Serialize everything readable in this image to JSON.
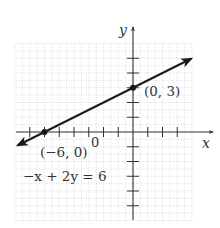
{
  "chart_data": {
    "type": "line",
    "title": "",
    "equation": "−x + 2y = 6",
    "xlabel": "x",
    "ylabel": "y",
    "origin_label": "0",
    "xlim": [
      -8,
      4
    ],
    "ylim": [
      -6,
      6
    ],
    "grid": true,
    "x_ticks": [
      -7,
      -6,
      -5,
      -4,
      -3,
      -2,
      -1,
      1,
      2,
      3
    ],
    "y_ticks": [
      -5,
      -4,
      -3,
      -2,
      -1,
      1,
      2,
      3,
      4,
      5
    ],
    "series": [
      {
        "name": "−x + 2y = 6",
        "slope": 0.5,
        "intercept": 3,
        "x": [
          -8,
          4
        ],
        "y": [
          -1,
          5
        ],
        "arrows_both_ends": true
      }
    ],
    "points": [
      {
        "x": -6,
        "y": 0,
        "label": "(−6, 0)"
      },
      {
        "x": 0,
        "y": 3,
        "label": "(0, 3)"
      }
    ]
  },
  "labels": {
    "x_axis": "x",
    "y_axis": "y",
    "origin": "0",
    "point_a": "(−6, 0)",
    "point_b": "(0, 3)",
    "equation": "−x + 2y = 6"
  },
  "colors": {
    "line": "#1a1a1a",
    "axis": "#333333",
    "grid": "#c8c8c8",
    "text": "#333333"
  }
}
